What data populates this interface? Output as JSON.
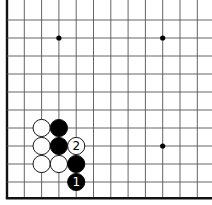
{
  "board": {
    "origin_x": 7,
    "origin_y": 2,
    "spacing_x": 17.3,
    "spacing_y": 18,
    "columns": 12,
    "rows": 11,
    "edges": [
      "left",
      "bottom"
    ],
    "line_color": "#555555",
    "edge_color": "#111111",
    "star_points": [
      [
        3,
        2
      ],
      [
        9,
        2
      ],
      [
        9,
        8
      ]
    ]
  },
  "stones": [
    {
      "color": "white",
      "col": 2,
      "row": 7,
      "label": ""
    },
    {
      "color": "black",
      "col": 3,
      "row": 7,
      "label": ""
    },
    {
      "color": "white",
      "col": 2,
      "row": 8,
      "label": ""
    },
    {
      "color": "black",
      "col": 3,
      "row": 8,
      "label": ""
    },
    {
      "color": "white",
      "col": 4,
      "row": 8,
      "label": "2"
    },
    {
      "color": "white",
      "col": 2,
      "row": 9,
      "label": ""
    },
    {
      "color": "white",
      "col": 3,
      "row": 9,
      "label": ""
    },
    {
      "color": "black",
      "col": 4,
      "row": 9,
      "label": ""
    },
    {
      "color": "black",
      "col": 4,
      "row": 10,
      "label": "1"
    }
  ]
}
